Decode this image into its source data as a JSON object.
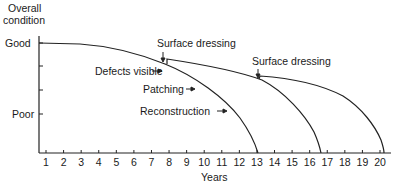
{
  "chart_data": {
    "type": "line",
    "title": "",
    "xlabel": "Years",
    "ylabel": "Overall condition",
    "x_ticks": [
      "1",
      "2",
      "3",
      "4",
      "5",
      "6",
      "7",
      "8",
      "9",
      "10",
      "11",
      "12",
      "13",
      "14",
      "15",
      "16",
      "17",
      "18",
      "19",
      "20"
    ],
    "y_tick_labels": {
      "good": "Good",
      "poor": "Poor"
    },
    "xlim": [
      0.6,
      20.6
    ],
    "series": [
      {
        "name": "Base deterioration / Reconstruction",
        "points": [
          [
            1,
            1.0
          ],
          [
            3,
            0.99
          ],
          [
            5,
            0.93
          ],
          [
            7,
            0.83
          ],
          [
            7.9,
            0.77
          ],
          [
            9,
            0.67
          ],
          [
            10,
            0.57
          ],
          [
            11,
            0.45
          ],
          [
            12,
            0.27
          ],
          [
            13,
            0.0
          ]
        ]
      },
      {
        "name": "After surface dressing (1st)",
        "points": [
          [
            7.9,
            0.77
          ],
          [
            7.9,
            0.81
          ],
          [
            10,
            0.77
          ],
          [
            12,
            0.71
          ],
          [
            12.8,
            0.66
          ],
          [
            14,
            0.55
          ],
          [
            15,
            0.43
          ],
          [
            16,
            0.24
          ],
          [
            16.6,
            0.0
          ]
        ]
      },
      {
        "name": "After surface dressing (2nd)",
        "points": [
          [
            12.8,
            0.66
          ],
          [
            12.9,
            0.69
          ],
          [
            14,
            0.68
          ],
          [
            15.5,
            0.64
          ],
          [
            17,
            0.57
          ],
          [
            18,
            0.49
          ],
          [
            19,
            0.34
          ],
          [
            19.7,
            0.18
          ],
          [
            20.2,
            0.0
          ]
        ]
      }
    ],
    "annotations": [
      {
        "text": "Surface dressing",
        "x": 7.9
      },
      {
        "text": "Defects visible",
        "x": 7.9
      },
      {
        "text": "Patching",
        "x": 9.2
      },
      {
        "text": "Reconstruction",
        "x": 11.8
      },
      {
        "text": "Surface dressing",
        "x": 12.8
      }
    ],
    "grid": false,
    "legend": "none"
  },
  "labels": {
    "ylabel_line1": "Overall",
    "ylabel_line2": "condition",
    "good": "Good",
    "poor": "Poor",
    "xlabel": "Years",
    "surface_dressing_1": "Surface dressing",
    "surface_dressing_2": "Surface dressing",
    "defects_visible": "Defects visible",
    "patching": "Patching",
    "reconstruction": "Reconstruction"
  }
}
